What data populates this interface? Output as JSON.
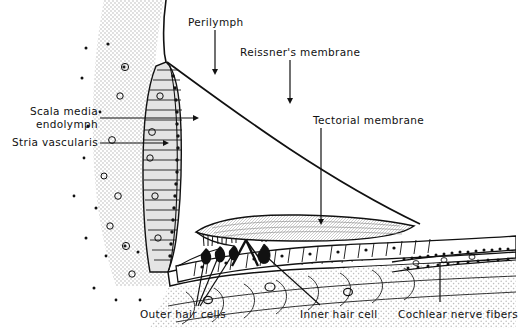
{
  "figure": {
    "type": "anatomical-line-diagram",
    "ink_color": "#111111",
    "stipple_color": "#b9b9b9",
    "background_color": "#ffffff",
    "width": 516,
    "height": 328
  },
  "labels": {
    "perilymph": "Perilymph",
    "reissners_membrane": "Reissner's membrane",
    "tectorial_membrane": "Tectorial membrane",
    "scala_media": "Scala media",
    "endolymph": "endolymph",
    "stria_vascularis": "Stria vascularis",
    "outer_hair_cells": "Outer hair cells",
    "inner_hair_cell": "Inner hair cell",
    "cochlear_nerve_fibers": "Cochlear nerve fibers"
  },
  "structures": [
    {
      "name": "stria-vascularis",
      "description": "columnar cell band along left wall"
    },
    {
      "name": "reissners-membrane",
      "description": "thin membrane sloping from upper left to lower right"
    },
    {
      "name": "tectorial-membrane",
      "description": "flattened lens-shaped membrane over hair cells"
    },
    {
      "name": "basilar-membrane",
      "description": "horizontal band beneath organ of Corti"
    },
    {
      "name": "spiral-ligament",
      "description": "stippled connective tissue at left"
    },
    {
      "name": "organ-of-corti",
      "description": "hair cell epithelium on basilar membrane"
    },
    {
      "name": "cochlear-nerve-fibers",
      "description": "nerve fiber bundle at lower right"
    }
  ]
}
